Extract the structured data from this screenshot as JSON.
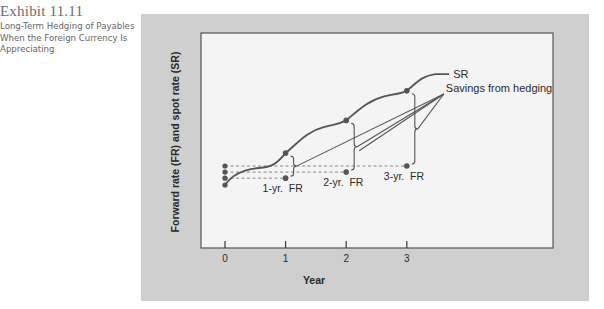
{
  "exhibit": {
    "number": "Exhibit 11.11",
    "caption": "Long-Term Hedging of Payables When the Foreign Currency Is Appreciating"
  },
  "chart_data": {
    "type": "line",
    "title": "Long-Term Hedging of Payables When the Foreign Currency Is Appreciating",
    "xlabel": "Year",
    "ylabel": "Forward rate (FR) and spot rate (SR)",
    "x_ticks": [
      "0",
      "1",
      "2",
      "3"
    ],
    "x_range": [
      0,
      3.6
    ],
    "grid": false,
    "series": [
      {
        "name": "SR",
        "label": "SR",
        "kind": "spot rate curve",
        "marked_points": [
          {
            "year": 0,
            "value": 0
          },
          {
            "year": 1,
            "value": 4.2
          },
          {
            "year": 2,
            "value": 8.5
          },
          {
            "year": 3,
            "value": 12.4
          }
        ],
        "end": {
          "year": 3.7,
          "value": 14.6
        }
      },
      {
        "name": "FR",
        "kind": "forward rates",
        "points": [
          {
            "year": 1,
            "value": 0.9,
            "label": "1-yr.  FR"
          },
          {
            "year": 2,
            "value": 1.7,
            "label": "2-yr.  FR"
          },
          {
            "year": 3,
            "value": 2.5,
            "label": "3-yr.  FR"
          }
        ]
      }
    ],
    "annotations": [
      {
        "text": "Savings from hedging",
        "points_to": [
          "year 1 gap",
          "year 2 gap",
          "year 3 gap"
        ]
      }
    ],
    "note": "Values are relative (no y-axis scale shown); dashed lines project each forward rate back to year 0."
  }
}
